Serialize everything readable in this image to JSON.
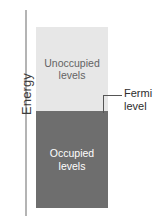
{
  "figure": {
    "axis": {
      "label": "Energy"
    },
    "regions": {
      "unoccupied": {
        "line1": "Unoccupied",
        "line2": "levels",
        "fill_color": "#e7e7e7",
        "text_color": "#636363"
      },
      "occupied": {
        "line1": "Occupied",
        "line2": "levels",
        "fill_color": "#6e6e6e",
        "text_color": "#ffffff"
      }
    },
    "callout": {
      "line1": "Fermi",
      "line2": "level",
      "leader_color": "#555555"
    }
  },
  "chart_data": {
    "type": "bar",
    "title": "",
    "xlabel": "",
    "ylabel": "Energy",
    "grid": false,
    "legend": "none",
    "orientation": "vertical",
    "categories": [
      "Occupied levels",
      "Unoccupied levels"
    ],
    "values": [
      53.6,
      46.4
    ],
    "units": "percent of bar height",
    "annotations": [
      {
        "text": "Fermi level",
        "at": "boundary between Occupied levels and Unoccupied levels",
        "fraction_from_bottom": 0.536
      }
    ],
    "axis_ranges": {
      "y": [
        "low energy",
        "high energy"
      ]
    }
  }
}
